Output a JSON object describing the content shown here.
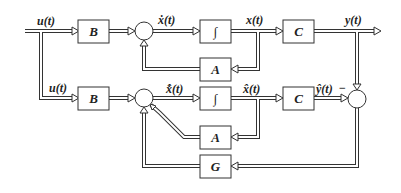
{
  "diagram": {
    "blocks": {
      "b_top": "B",
      "int_top": "∫",
      "c_top": "C",
      "a_top": "A",
      "b_bot": "B",
      "int_bot": "∫",
      "c_bot": "C",
      "a_bot": "A",
      "g": "G"
    },
    "signals": {
      "u_top": "u(t)",
      "xdot": "ẋ(t)",
      "x": "x(t)",
      "y": "y(t)",
      "u_bot": "u(t)",
      "xhatdot": "x̂̇(t)",
      "xhat": "x̂(t)",
      "yhat": "ŷ(t)",
      "minus": "−"
    },
    "colors": {
      "line": "#333333",
      "background": "#ffffff"
    }
  }
}
